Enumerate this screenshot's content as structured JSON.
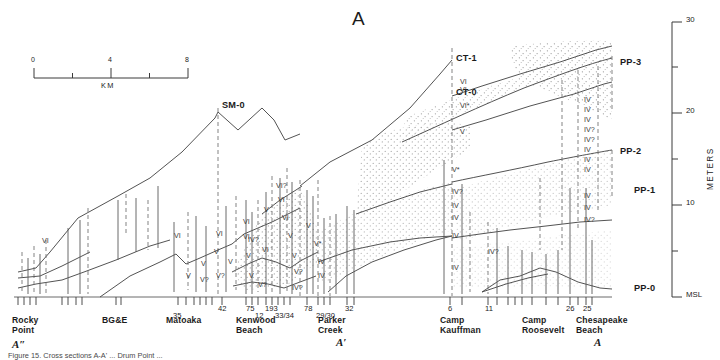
{
  "figure": {
    "title": "A",
    "caption": "Figure 15. Cross sections A-A' ... Drum Point ...",
    "meta": {
      "width": 720,
      "height": 360
    }
  },
  "scalebar": {
    "ticks": [
      "0",
      "4",
      "8"
    ],
    "unit_label": "KM",
    "minor_count": 4
  },
  "yaxis": {
    "name": "METERS",
    "labels": [
      "MSL",
      "10",
      "20",
      "30"
    ],
    "values": [
      0,
      10,
      20,
      30
    ],
    "minor_step": 5
  },
  "section_markers": {
    "left": "A″",
    "middle": "A′",
    "right": "A"
  },
  "unit_markers": [
    {
      "id": "SM-0",
      "label": "SM-0",
      "x": 218,
      "y": 104
    },
    {
      "id": "CT-1",
      "label": "CT-1",
      "x": 452,
      "y": 58
    },
    {
      "id": "CT-0",
      "label": "CT-0",
      "x": 452,
      "y": 92
    },
    {
      "id": "PP-3",
      "label": "PP-3",
      "x": 621,
      "y": 62
    },
    {
      "id": "PP-2",
      "label": "PP-2",
      "x": 621,
      "y": 152
    },
    {
      "id": "PP-1",
      "label": "PP-1",
      "x": 636,
      "y": 190
    },
    {
      "id": "PP-0",
      "label": "PP-0",
      "x": 636,
      "y": 288
    }
  ],
  "sites": [
    {
      "name": "Rocky\nPoint",
      "x": 12,
      "ticks": []
    },
    {
      "name": "BG&E",
      "x": 104,
      "ticks": []
    },
    {
      "name": "Matoaka",
      "x": 171,
      "ticks": [
        {
          "label": "35",
          "x": 178,
          "sub": true
        },
        {
          "label": "42",
          "x": 222,
          "sub": false
        }
      ]
    },
    {
      "name": "Kenwood\nBeach",
      "x": 237,
      "ticks": [
        {
          "label": "75",
          "x": 250,
          "sub": false
        },
        {
          "label": "12",
          "x": 258,
          "sub": true
        },
        {
          "label": "193",
          "x": 270,
          "sub": false
        },
        {
          "label": "33/34",
          "x": 282,
          "sub": true
        },
        {
          "label": "78",
          "x": 307,
          "sub": false
        }
      ]
    },
    {
      "name": "Parker\nCreek",
      "x": 319,
      "ticks": [
        {
          "label": "29/30",
          "x": 325,
          "sub": true
        },
        {
          "label": "32",
          "x": 347,
          "sub": false
        }
      ]
    },
    {
      "name": "Camp\nKauffman",
      "x": 443,
      "ticks": [
        {
          "label": "6",
          "x": 450,
          "sub": false
        },
        {
          "label": "11",
          "x": 488,
          "sub": false
        }
      ]
    },
    {
      "name": "Camp\nRoosevelt",
      "x": 525,
      "ticks": []
    },
    {
      "name": "Chesapeake\nBeach",
      "x": 578,
      "ticks": [
        {
          "label": "26",
          "x": 570,
          "sub": false
        },
        {
          "label": "25",
          "x": 586,
          "sub": false
        }
      ]
    }
  ],
  "roman_annotations": [
    {
      "t": "VI",
      "x": 42,
      "y": 237
    },
    {
      "t": "VI",
      "x": 174,
      "y": 232
    },
    {
      "t": "V",
      "x": 186,
      "y": 272
    },
    {
      "t": "V",
      "x": 201,
      "y": 260
    },
    {
      "t": "V?",
      "x": 200,
      "y": 276
    },
    {
      "t": "VI",
      "x": 216,
      "y": 230
    },
    {
      "t": "V",
      "x": 214,
      "y": 248
    },
    {
      "t": "V?",
      "x": 216,
      "y": 272
    },
    {
      "t": "V",
      "x": 228,
      "y": 258
    },
    {
      "t": "VI",
      "x": 243,
      "y": 218
    },
    {
      "t": "VI",
      "x": 243,
      "y": 233
    },
    {
      "t": "V",
      "x": 246,
      "y": 252
    },
    {
      "t": "V",
      "x": 249,
      "y": 272
    },
    {
      "t": "V?",
      "x": 258,
      "y": 281
    },
    {
      "t": "VI",
      "x": 262,
      "y": 246
    },
    {
      "t": "V",
      "x": 264,
      "y": 206
    },
    {
      "t": "VI?",
      "x": 276,
      "y": 182
    },
    {
      "t": "VI",
      "x": 278,
      "y": 196
    },
    {
      "t": "VI",
      "x": 282,
      "y": 214
    },
    {
      "t": "V",
      "x": 288,
      "y": 232
    },
    {
      "t": "V",
      "x": 292,
      "y": 252
    },
    {
      "t": "V?",
      "x": 294,
      "y": 268
    },
    {
      "t": "IV?",
      "x": 292,
      "y": 284
    },
    {
      "t": "IV?",
      "x": 248,
      "y": 236
    },
    {
      "t": "V*",
      "x": 314,
      "y": 240
    },
    {
      "t": "IV",
      "x": 318,
      "y": 258
    },
    {
      "t": "IV",
      "x": 318,
      "y": 272
    },
    {
      "t": "V",
      "x": 306,
      "y": 222
    },
    {
      "t": "VI",
      "x": 460,
      "y": 78
    },
    {
      "t": "VI",
      "x": 460,
      "y": 86
    },
    {
      "t": "VI*",
      "x": 460,
      "y": 102
    },
    {
      "t": "V",
      "x": 460,
      "y": 128
    },
    {
      "t": "V*",
      "x": 452,
      "y": 166
    },
    {
      "t": "IV?",
      "x": 452,
      "y": 188
    },
    {
      "t": "IV",
      "x": 452,
      "y": 202
    },
    {
      "t": "IV",
      "x": 452,
      "y": 214
    },
    {
      "t": "IV",
      "x": 452,
      "y": 232
    },
    {
      "t": "IV",
      "x": 452,
      "y": 264
    },
    {
      "t": "IV?",
      "x": 488,
      "y": 248
    },
    {
      "t": "IV",
      "x": 584,
      "y": 96
    },
    {
      "t": "IV",
      "x": 584,
      "y": 106
    },
    {
      "t": "IV",
      "x": 584,
      "y": 116
    },
    {
      "t": "IV?",
      "x": 584,
      "y": 126
    },
    {
      "t": "IV?",
      "x": 584,
      "y": 136
    },
    {
      "t": "IV",
      "x": 584,
      "y": 146
    },
    {
      "t": "IV",
      "x": 584,
      "y": 156
    },
    {
      "t": "IV",
      "x": 584,
      "y": 166
    },
    {
      "t": "IV",
      "x": 584,
      "y": 192
    },
    {
      "t": "IV",
      "x": 584,
      "y": 204
    },
    {
      "t": "IV?",
      "x": 584,
      "y": 216
    }
  ],
  "colors": {
    "line": "#4a4a4a",
    "line_dark": "#2e2e2e",
    "text": "#1b1b1b",
    "stipple": "#8a8a8a",
    "background": "#ffffff"
  }
}
